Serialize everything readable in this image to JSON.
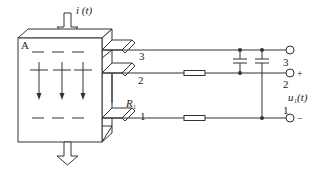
{
  "diagram": {
    "current_label": "i (t)",
    "block_label": "A",
    "resistor_label": "R",
    "resistor_subscript": "1",
    "terminals": {
      "left": [
        "3",
        "2",
        "1"
      ],
      "right": [
        "3",
        "2",
        "1"
      ]
    },
    "polarity": {
      "plus": "+",
      "minus": "−"
    },
    "output_label": "u",
    "output_subscript": "1",
    "output_arg": " (t)",
    "colors": {
      "line": "#333333",
      "background": "#ffffff"
    }
  }
}
